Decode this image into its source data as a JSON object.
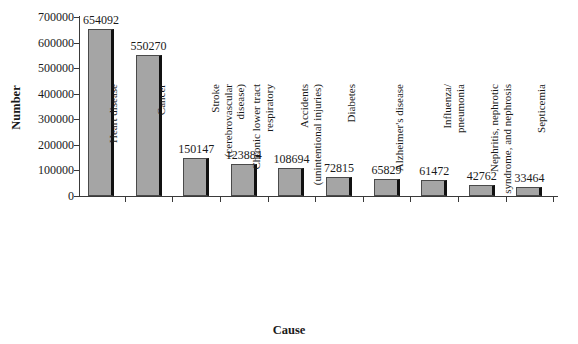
{
  "chart_data": {
    "type": "bar",
    "title": "",
    "xlabel": "Cause",
    "ylabel": "Number",
    "ylim": [
      0,
      700000
    ],
    "ytick_labels": [
      "700000",
      "600000",
      "500000",
      "400000",
      "300000",
      "200000",
      "100000",
      "0"
    ],
    "ytick_values": [
      700000,
      600000,
      500000,
      400000,
      300000,
      200000,
      100000,
      0
    ],
    "grid": false,
    "legend": null,
    "categories": [
      "Heart disease",
      "Cancer",
      "Stroke\n(cerebrovascular\ndisease)",
      "Chronic lower tract\nrespiratory",
      "Accidents\n(unintentional injuries)",
      "Diabetes",
      "Alzheimer's disease",
      "Influenza/\npneumonia",
      "Nephritis, nephrotic\nsyndrome, and nephrosis",
      "Septicemia"
    ],
    "values": [
      654092,
      550270,
      150147,
      123884,
      108694,
      72815,
      65829,
      61472,
      42762,
      33464
    ],
    "data_labels": [
      "654092",
      "550270",
      "150147",
      "123884",
      "108694",
      "72815",
      "65829",
      "61472",
      "42762",
      "33464"
    ],
    "bar_color": "#a5a5a5",
    "bar_edge_color": "#111111",
    "axis_color": "#3a3a3a"
  }
}
